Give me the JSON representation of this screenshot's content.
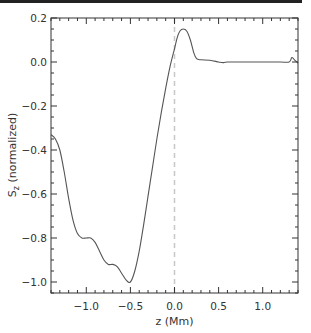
{
  "chart_data": {
    "type": "line",
    "title": "",
    "xlabel": "z (Mm)",
    "ylabel": "S_z (normalized)",
    "ylabel_main": "S",
    "ylabel_sub": "z",
    "ylabel_rest": " (normalized)",
    "xlim": [
      -1.4,
      1.4
    ],
    "ylim": [
      -1.05,
      0.2
    ],
    "xticks": [
      -1.0,
      -0.5,
      0.0,
      0.5,
      1.0
    ],
    "xtick_labels": [
      "-1.0",
      "-0.5",
      "0.0",
      "0.5",
      "1.0"
    ],
    "yticks": [
      -1.0,
      -0.8,
      -0.6,
      -0.4,
      -0.2,
      0.0,
      0.2
    ],
    "ytick_labels": [
      "-1.0",
      "-0.8",
      "-0.6",
      "-0.4",
      "-0.2",
      "0.0",
      "0.2"
    ],
    "grid": false,
    "legend": null,
    "reference_line": {
      "x": 0.0,
      "style": "dashed",
      "color": "#c8c8c8"
    },
    "series": [
      {
        "name": "S_z",
        "color": "#555555",
        "x": [
          -1.4,
          -1.35,
          -1.3,
          -1.25,
          -1.2,
          -1.15,
          -1.1,
          -1.05,
          -1.0,
          -0.95,
          -0.9,
          -0.85,
          -0.8,
          -0.75,
          -0.7,
          -0.65,
          -0.6,
          -0.55,
          -0.5,
          -0.45,
          -0.4,
          -0.35,
          -0.3,
          -0.25,
          -0.2,
          -0.15,
          -0.1,
          -0.05,
          0.0,
          0.03,
          0.06,
          0.1,
          0.14,
          0.18,
          0.22,
          0.25,
          0.3,
          0.4,
          0.5,
          0.55,
          0.6,
          0.8,
          1.0,
          1.2,
          1.3,
          1.33,
          1.36,
          1.4
        ],
        "y": [
          -0.33,
          -0.35,
          -0.4,
          -0.5,
          -0.62,
          -0.72,
          -0.78,
          -0.8,
          -0.8,
          -0.8,
          -0.82,
          -0.86,
          -0.9,
          -0.92,
          -0.92,
          -0.93,
          -0.96,
          -0.99,
          -1.0,
          -0.95,
          -0.86,
          -0.74,
          -0.61,
          -0.48,
          -0.35,
          -0.23,
          -0.12,
          -0.02,
          0.06,
          0.11,
          0.14,
          0.15,
          0.14,
          0.1,
          0.04,
          0.015,
          0.01,
          0.008,
          0.0,
          -0.003,
          0.0,
          0.0,
          0.0,
          0.0,
          0.0,
          0.02,
          0.01,
          -0.005
        ]
      }
    ]
  }
}
